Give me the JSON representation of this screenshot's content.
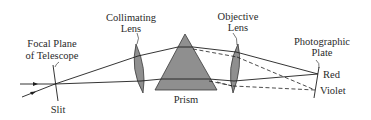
{
  "diagram": {
    "type": "prism spectrograph optical path",
    "labels": {
      "focal_plane": [
        "Focal Plane",
        "of Telescope"
      ],
      "slit": "Slit",
      "collimating_lens": [
        "Collimating",
        "Lens"
      ],
      "prism": "Prism",
      "objective_lens": [
        "Objective",
        "Lens"
      ],
      "photographic_plate": [
        "Photographic",
        "Plate"
      ],
      "red": "Red",
      "violet": "Violet"
    },
    "colors": {
      "line": "#1e1e1e",
      "glass_fill": "#8f8f8f",
      "glass_stroke": "#3a3a3a",
      "background": "#ffffff"
    }
  }
}
